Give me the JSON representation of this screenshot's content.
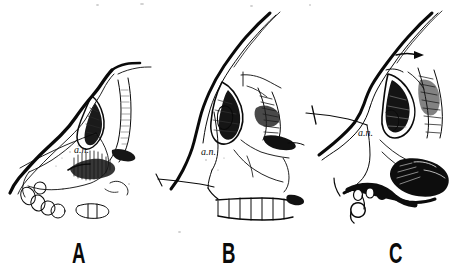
{
  "figure": {
    "kind": "anatomical-line-drawing",
    "background_color": "#ffffff",
    "ink_color": "#0a0a0a",
    "width": 452,
    "height": 275,
    "panel_count": 3
  },
  "panels": [
    {
      "letter": "A",
      "letter_x": 72,
      "letter_y": 238,
      "an_label": "a.n.",
      "an_x": 74,
      "an_y": 144,
      "caption_subject": "ape-like prognathous facial profile with exposed tooth row",
      "has_reference_line": true,
      "has_teeth_row": true,
      "has_arrow_marker": false
    },
    {
      "letter": "B",
      "letter_x": 222,
      "letter_y": 238,
      "an_label": "a.n.",
      "an_x": 201,
      "an_y": 146,
      "caption_subject": "human skull facial profile with vertical nasal aperture",
      "has_reference_line": true,
      "has_teeth_row": true,
      "has_arrow_marker": false
    },
    {
      "letter": "C",
      "letter_x": 389,
      "letter_y": 238,
      "an_label": "a.n.",
      "an_x": 358,
      "an_y": 127,
      "caption_subject": "intermediate facial profile with heavy shading on maxilla",
      "has_reference_line": true,
      "has_teeth_row": false,
      "has_arrow_marker": true
    }
  ],
  "annotations": {
    "an_meaning": "a.n.",
    "letters": [
      "A",
      "B",
      "C"
    ]
  }
}
